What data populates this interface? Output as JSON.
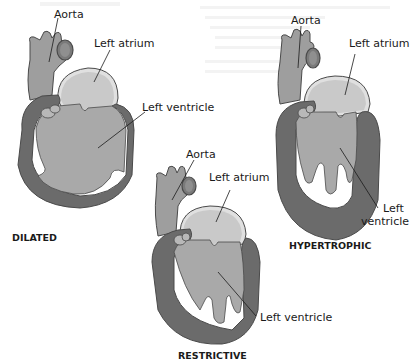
{
  "figure": {
    "colors": {
      "muscle": "#6b6b6b",
      "chamber": "#a9a9a9",
      "atrium": "#c9c9c9",
      "aorta": "#9e9e9e",
      "outline": "#4a4a4a",
      "text": "#1a1a1a"
    },
    "hearts": [
      {
        "id": "dilated",
        "caption": "DILATED",
        "labels": {
          "aorta": "Aorta",
          "atrium": "Left atrium",
          "ventricle": "Left ventricle"
        }
      },
      {
        "id": "hypertrophic",
        "caption": "HYPERTROPHIC",
        "labels": {
          "aorta": "Aorta",
          "atrium": "Left atrium",
          "ventricle_line1": "Left",
          "ventricle_line2": "ventricle"
        }
      },
      {
        "id": "restrictive",
        "caption": "RESTRICTIVE",
        "labels": {
          "aorta": "Aorta",
          "atrium": "Left atrium",
          "ventricle": "Left ventricle"
        }
      }
    ]
  }
}
